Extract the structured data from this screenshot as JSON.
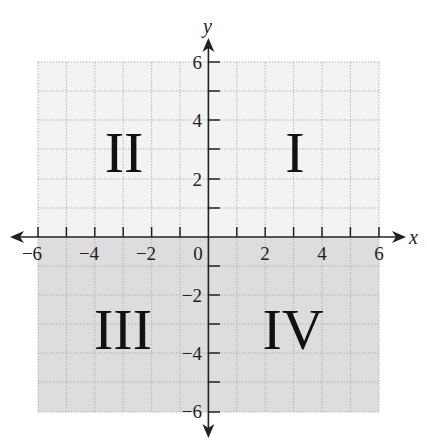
{
  "figure": {
    "x_axis_label": "x",
    "y_axis_label": "y",
    "x_ticks": [
      "−6",
      "−4",
      "−2",
      "0",
      "2",
      "4",
      "6"
    ],
    "y_ticks_pos": [
      "6",
      "4",
      "2"
    ],
    "y_ticks_neg": [
      "−2",
      "−4",
      "−6"
    ],
    "quadrants": {
      "q1": "I",
      "q2": "II",
      "q3": "III",
      "q4": "IV"
    },
    "colors": {
      "upper_fill": "#f2f2f2",
      "lower_fill": "#dcdcdc",
      "grid": "#b8b8b8",
      "axis": "#222222"
    }
  }
}
